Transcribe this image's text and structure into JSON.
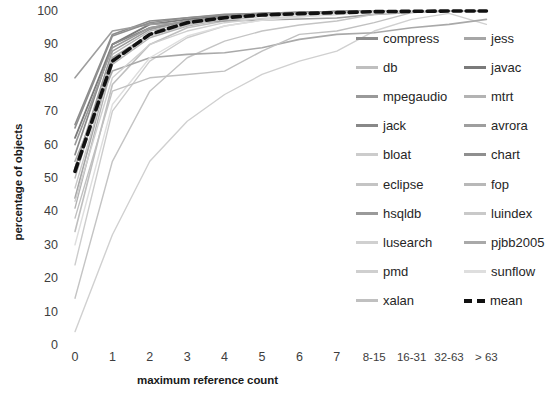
{
  "chart_data": {
    "type": "line",
    "title": "",
    "xlabel": "maximum reference count",
    "ylabel": "percentage of objects",
    "x_categories": [
      "0",
      "1",
      "2",
      "3",
      "4",
      "5",
      "6",
      "7",
      "8-15",
      "16-31",
      "32-63",
      "> 63"
    ],
    "y_ticks": [
      0,
      10,
      20,
      30,
      40,
      50,
      60,
      70,
      80,
      90,
      100
    ],
    "ylim": [
      0,
      100
    ],
    "grid": false,
    "legend_position": "right",
    "legend_columns": 2,
    "series": [
      {
        "name": "compress",
        "color": "#8c8c8c",
        "width": 1.6,
        "dash": "none",
        "values": [
          66,
          93,
          97,
          98,
          99,
          99.3,
          99.6,
          99.8,
          100,
          100,
          100,
          100
        ]
      },
      {
        "name": "jess",
        "color": "#a6a6a6",
        "width": 1.6,
        "dash": "none",
        "values": [
          44,
          86,
          93,
          96,
          98,
          99,
          99.4,
          99.7,
          100,
          100,
          100,
          100
        ]
      },
      {
        "name": "db",
        "color": "#bfbfbf",
        "width": 1.6,
        "dash": "none",
        "values": [
          34,
          78,
          90,
          95,
          97,
          98.5,
          99.2,
          99.6,
          100,
          100,
          100,
          100
        ]
      },
      {
        "name": "javac",
        "color": "#7a7a7a",
        "width": 1.8,
        "dash": "none",
        "values": [
          62,
          90,
          96,
          97.5,
          98.5,
          99.2,
          99.5,
          99.8,
          100,
          100,
          100,
          100
        ]
      },
      {
        "name": "mpegaudio",
        "color": "#999999",
        "width": 1.6,
        "dash": "none",
        "values": [
          53,
          88,
          94.5,
          97,
          98.3,
          99,
          99.4,
          99.7,
          100,
          100,
          100,
          100
        ]
      },
      {
        "name": "mtrt",
        "color": "#b3b3b3",
        "width": 1.4,
        "dash": "none",
        "values": [
          41,
          84,
          92,
          95.5,
          97.5,
          98.6,
          99.2,
          99.6,
          100,
          100,
          100,
          100
        ]
      },
      {
        "name": "jack",
        "color": "#888888",
        "width": 1.6,
        "dash": "none",
        "values": [
          57,
          90,
          95,
          97,
          98.4,
          99.1,
          99.5,
          99.8,
          100,
          100,
          100,
          100
        ]
      },
      {
        "name": "avrora",
        "color": "#9e9e9e",
        "width": 1.6,
        "dash": "none",
        "values": [
          80,
          94,
          96,
          96.5,
          97,
          97.3,
          97.6,
          97.9,
          99,
          99.6,
          100,
          100
        ]
      },
      {
        "name": "bloat",
        "color": "#cccccc",
        "width": 1.4,
        "dash": "none",
        "values": [
          24,
          70,
          85,
          92,
          95.5,
          97.3,
          98.3,
          99,
          99.8,
          100,
          100,
          100
        ]
      },
      {
        "name": "chart",
        "color": "#8f8f8f",
        "width": 1.6,
        "dash": "none",
        "values": [
          65,
          92.5,
          96.5,
          98,
          98.8,
          99.3,
          99.6,
          99.8,
          100,
          100,
          100,
          100
        ]
      },
      {
        "name": "eclipse",
        "color": "#c4c4c4",
        "width": 1.4,
        "dash": "none",
        "values": [
          14,
          55,
          76,
          86,
          91,
          94,
          95.8,
          97,
          99,
          99.7,
          100,
          100
        ]
      },
      {
        "name": "fop",
        "color": "#b8b8b8",
        "width": 1.4,
        "dash": "none",
        "values": [
          50,
          87,
          94,
          96.5,
          98,
          98.8,
          99.3,
          99.6,
          100,
          100,
          100,
          100
        ]
      },
      {
        "name": "hsqldb",
        "color": "#9a9a9a",
        "width": 1.6,
        "dash": "none",
        "values": [
          60,
          89,
          95,
          97,
          98.2,
          99,
          99.4,
          99.7,
          100,
          100,
          100,
          100
        ]
      },
      {
        "name": "luindex",
        "color": "#c9c9c9",
        "width": 1.4,
        "dash": "none",
        "values": [
          47,
          85,
          92.5,
          95.8,
          97.6,
          98.6,
          99.2,
          99.6,
          100,
          100,
          100,
          100
        ]
      },
      {
        "name": "lusearch",
        "color": "#d0d0d0",
        "width": 1.4,
        "dash": "none",
        "values": [
          4,
          33,
          55,
          67,
          75,
          81,
          85,
          88,
          94,
          97.5,
          99.3,
          96
        ]
      },
      {
        "name": "pjbb2005",
        "color": "#a9a9a9",
        "width": 1.6,
        "dash": "none",
        "values": [
          55,
          82,
          86,
          87,
          87.5,
          89,
          91.5,
          93,
          93.5,
          95,
          96,
          97.5
        ]
      },
      {
        "name": "pmd",
        "color": "#cfcfcf",
        "width": 1.4,
        "dash": "none",
        "values": [
          43,
          80,
          90,
          94,
          96.5,
          97.8,
          98.5,
          99,
          99.8,
          100,
          100,
          100
        ]
      },
      {
        "name": "sunflow",
        "color": "#dedede",
        "width": 1.4,
        "dash": "none",
        "values": [
          30,
          72,
          86,
          92.5,
          95.5,
          97.2,
          98.2,
          98.9,
          99.7,
          100,
          100,
          100
        ]
      },
      {
        "name": "xalan",
        "color": "#c0c0c0",
        "width": 1.4,
        "dash": "none",
        "values": [
          38,
          76,
          80,
          81,
          82,
          88,
          93,
          94,
          96.5,
          99.5,
          100,
          100
        ]
      },
      {
        "name": "mean",
        "color": "#111111",
        "width": 3.6,
        "dash": "dashed",
        "values": [
          52,
          85,
          93,
          96.5,
          98,
          98.8,
          99.2,
          99.5,
          99.8,
          99.9,
          100,
          100
        ]
      }
    ]
  },
  "legend": {
    "column1": [
      {
        "label": "compress",
        "color": "#8c8c8c",
        "dash": "none"
      },
      {
        "label": "db",
        "color": "#bfbfbf",
        "dash": "none"
      },
      {
        "label": "mpegaudio",
        "color": "#999999",
        "dash": "none"
      },
      {
        "label": "jack",
        "color": "#888888",
        "dash": "none"
      },
      {
        "label": "bloat",
        "color": "#cccccc",
        "dash": "none"
      },
      {
        "label": "eclipse",
        "color": "#c4c4c4",
        "dash": "none"
      },
      {
        "label": "hsqldb",
        "color": "#9a9a9a",
        "dash": "none"
      },
      {
        "label": "lusearch",
        "color": "#d0d0d0",
        "dash": "none"
      },
      {
        "label": "pmd",
        "color": "#cfcfcf",
        "dash": "none"
      },
      {
        "label": "xalan",
        "color": "#c0c0c0",
        "dash": "none"
      }
    ],
    "column2": [
      {
        "label": "jess",
        "color": "#a6a6a6",
        "dash": "none"
      },
      {
        "label": "javac",
        "color": "#7a7a7a",
        "dash": "none"
      },
      {
        "label": "mtrt",
        "color": "#b3b3b3",
        "dash": "none"
      },
      {
        "label": "avrora",
        "color": "#9e9e9e",
        "dash": "none"
      },
      {
        "label": "chart",
        "color": "#8f8f8f",
        "dash": "none"
      },
      {
        "label": "fop",
        "color": "#b8b8b8",
        "dash": "none"
      },
      {
        "label": "luindex",
        "color": "#c9c9c9",
        "dash": "none"
      },
      {
        "label": "pjbb2005",
        "color": "#a9a9a9",
        "dash": "none"
      },
      {
        "label": "sunflow",
        "color": "#dedede",
        "dash": "none"
      },
      {
        "label": "mean",
        "color": "#111111",
        "dash": "dashed"
      }
    ]
  }
}
